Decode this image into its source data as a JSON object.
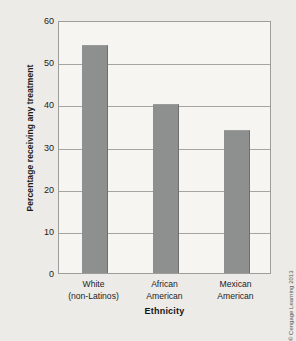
{
  "chart_data": {
    "type": "bar",
    "title": "",
    "subtitle": "",
    "categories": [
      "White (non-Latinos)",
      "African American",
      "Mexican American"
    ],
    "category_lines": [
      [
        "White",
        "(non-Latinos)"
      ],
      [
        "African",
        "American"
      ],
      [
        "Mexican",
        "American"
      ]
    ],
    "values": [
      54,
      40,
      34
    ],
    "xlabel": "Ethnicity",
    "ylabel": "Percentage receiving any treatment",
    "ylim": [
      0,
      60
    ],
    "yticks": [
      60,
      50,
      40,
      30,
      20,
      10,
      0
    ],
    "ytick_labels": [
      "60",
      "50",
      "40",
      "30",
      "20",
      "10",
      "0"
    ],
    "grid": true,
    "grid_axis": "y",
    "legend": false,
    "legend_position": "none",
    "annotations": []
  },
  "figure": {
    "credit": "© Cengage Learning 2013"
  },
  "colors": {
    "figure_background": "#ecebe8",
    "plot_background": "#f6f5f2",
    "bar_fill": "#8e8f8f",
    "bar_edge": "#6e6f6f",
    "gridline": "#a4a4a1",
    "axis_border": "#9d9d9a",
    "text": "#1c1c1c"
  }
}
